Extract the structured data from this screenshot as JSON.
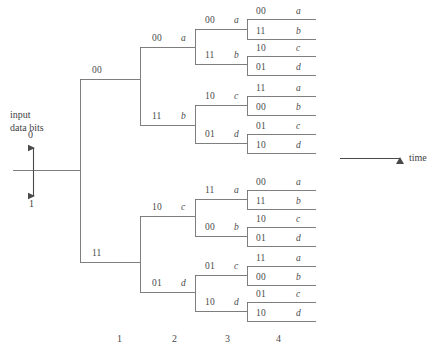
{
  "figure": {
    "line_color": "#6f6f6f",
    "text_color": "#4a4a4a",
    "background": "#ffffff"
  },
  "input": {
    "caption_line1": "input",
    "caption_line2": "data bits",
    "top_label": "0",
    "bottom_label": "1",
    "arrow_icon": "double-headed-vertical-arrow-icon"
  },
  "time_axis": {
    "label": "time",
    "arrow_icon": "right-arrow-icon"
  },
  "stage_axis": {
    "labels": [
      "1",
      "2",
      "3",
      "4"
    ],
    "x_positions": [
      120,
      175,
      228,
      279
    ]
  },
  "tree": {
    "levels": [
      {
        "level": 1,
        "branches": [
          {
            "bits": "00",
            "state": "",
            "path": "0"
          },
          {
            "bits": "11",
            "state": "",
            "path": "1"
          }
        ]
      },
      {
        "level": 2,
        "branches": [
          {
            "bits": "00",
            "state": "a",
            "path": "00"
          },
          {
            "bits": "11",
            "state": "b",
            "path": "01"
          },
          {
            "bits": "10",
            "state": "c",
            "path": "10"
          },
          {
            "bits": "01",
            "state": "d",
            "path": "11"
          }
        ]
      },
      {
        "level": 3,
        "branches": [
          {
            "bits": "00",
            "state": "a",
            "path": "000"
          },
          {
            "bits": "11",
            "state": "b",
            "path": "001"
          },
          {
            "bits": "10",
            "state": "c",
            "path": "010"
          },
          {
            "bits": "01",
            "state": "d",
            "path": "011"
          },
          {
            "bits": "11",
            "state": "a",
            "path": "100"
          },
          {
            "bits": "00",
            "state": "b",
            "path": "101"
          },
          {
            "bits": "01",
            "state": "c",
            "path": "110"
          },
          {
            "bits": "10",
            "state": "d",
            "path": "111"
          }
        ]
      },
      {
        "level": 4,
        "branches": [
          {
            "bits": "00",
            "state": "a",
            "path": "0000"
          },
          {
            "bits": "11",
            "state": "b",
            "path": "0001"
          },
          {
            "bits": "10",
            "state": "c",
            "path": "0010"
          },
          {
            "bits": "01",
            "state": "d",
            "path": "0011"
          },
          {
            "bits": "11",
            "state": "a",
            "path": "0100"
          },
          {
            "bits": "00",
            "state": "b",
            "path": "0101"
          },
          {
            "bits": "01",
            "state": "c",
            "path": "0110"
          },
          {
            "bits": "10",
            "state": "d",
            "path": "0111"
          },
          {
            "bits": "00",
            "state": "a",
            "path": "1000"
          },
          {
            "bits": "11",
            "state": "b",
            "path": "1001"
          },
          {
            "bits": "10",
            "state": "c",
            "path": "1010"
          },
          {
            "bits": "01",
            "state": "d",
            "path": "1011"
          },
          {
            "bits": "11",
            "state": "a",
            "path": "1100"
          },
          {
            "bits": "00",
            "state": "b",
            "path": "1101"
          },
          {
            "bits": "01",
            "state": "c",
            "path": "1110"
          },
          {
            "bits": "10",
            "state": "d",
            "path": "1111"
          }
        ]
      }
    ]
  }
}
